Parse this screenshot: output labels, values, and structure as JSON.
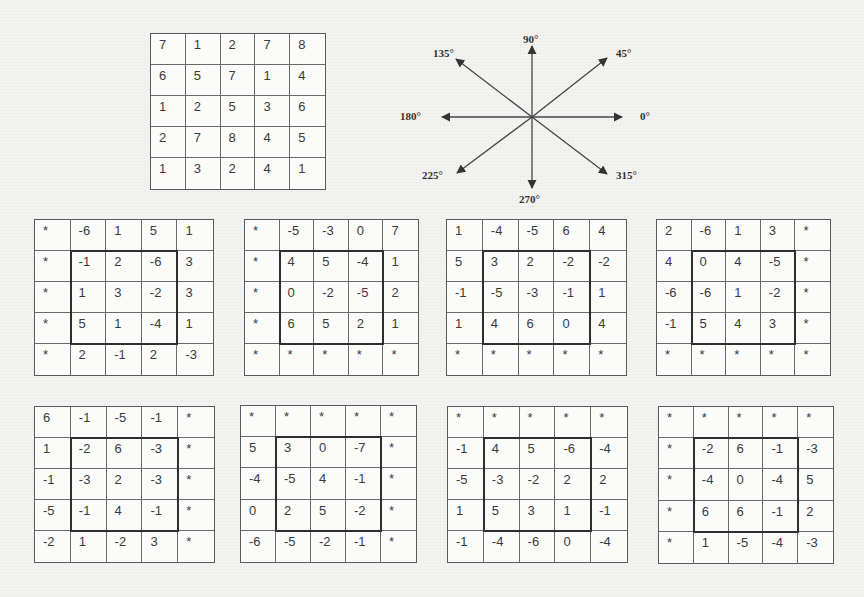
{
  "figure": {
    "source_grid": {
      "rows": [
        [
          "7",
          "1",
          "2",
          "7",
          "8"
        ],
        [
          "6",
          "5",
          "7",
          "1",
          "4"
        ],
        [
          "1",
          "2",
          "5",
          "3",
          "6"
        ],
        [
          "2",
          "7",
          "8",
          "4",
          "5"
        ],
        [
          "1",
          "3",
          "2",
          "4",
          "1"
        ]
      ]
    },
    "compass": {
      "labels": {
        "deg0": "0°",
        "deg45": "45°",
        "deg90": "90°",
        "deg135": "135°",
        "deg180": "180°",
        "deg225": "225°",
        "deg270": "270°",
        "deg315": "315°"
      }
    },
    "direction_grids": [
      {
        "rows": [
          [
            "*",
            "-6",
            "1",
            "5",
            "1"
          ],
          [
            "*",
            "-1",
            "2",
            "-6",
            "3"
          ],
          [
            "*",
            "1",
            "3",
            "-2",
            "3"
          ],
          [
            "*",
            "5",
            "1",
            "-4",
            "1"
          ],
          [
            "*",
            "2",
            "-1",
            "2",
            "-3"
          ]
        ]
      },
      {
        "rows": [
          [
            "*",
            "-5",
            "-3",
            "0",
            "7"
          ],
          [
            "*",
            "4",
            "5",
            "-4",
            "1"
          ],
          [
            "*",
            "0",
            "-2",
            "-5",
            "2"
          ],
          [
            "*",
            "6",
            "5",
            "2",
            "1"
          ],
          [
            "*",
            "*",
            "*",
            "*",
            "*"
          ]
        ]
      },
      {
        "rows": [
          [
            "1",
            "-4",
            "-5",
            "6",
            "4"
          ],
          [
            "5",
            "3",
            "2",
            "-2",
            "-2"
          ],
          [
            "-1",
            "-5",
            "-3",
            "-1",
            "1"
          ],
          [
            "1",
            "4",
            "6",
            "0",
            "4"
          ],
          [
            "*",
            "*",
            "*",
            "*",
            "*"
          ]
        ]
      },
      {
        "rows": [
          [
            "2",
            "-6",
            "1",
            "3",
            "*"
          ],
          [
            "4",
            "0",
            "4",
            "-5",
            "*"
          ],
          [
            "-6",
            "-6",
            "1",
            "-2",
            "*"
          ],
          [
            "-1",
            "5",
            "4",
            "3",
            "*"
          ],
          [
            "*",
            "*",
            "*",
            "*",
            "*"
          ]
        ]
      },
      {
        "rows": [
          [
            "6",
            "-1",
            "-5",
            "-1",
            "*"
          ],
          [
            "1",
            "-2",
            "6",
            "-3",
            "*"
          ],
          [
            "-1",
            "-3",
            "2",
            "-3",
            "*"
          ],
          [
            "-5",
            "-1",
            "4",
            "-1",
            "*"
          ],
          [
            "-2",
            "1",
            "-2",
            "3",
            "*"
          ]
        ]
      },
      {
        "rows": [
          [
            "*",
            "*",
            "*",
            "*",
            "*"
          ],
          [
            "5",
            "3",
            "0",
            "-7",
            "*"
          ],
          [
            "-4",
            "-5",
            "4",
            "-1",
            "*"
          ],
          [
            "0",
            "2",
            "5",
            "-2",
            "*"
          ],
          [
            "-6",
            "-5",
            "-2",
            "-1",
            "*"
          ]
        ]
      },
      {
        "rows": [
          [
            "*",
            "*",
            "*",
            "*",
            "*"
          ],
          [
            "-1",
            "4",
            "5",
            "-6",
            "-4"
          ],
          [
            "-5",
            "-3",
            "-2",
            "2",
            "2"
          ],
          [
            "1",
            "5",
            "3",
            "1",
            "-1"
          ],
          [
            "-1",
            "-4",
            "-6",
            "0",
            "-4"
          ]
        ]
      },
      {
        "rows": [
          [
            "*",
            "*",
            "*",
            "*",
            "*"
          ],
          [
            "*",
            "-2",
            "6",
            "-1",
            "-3"
          ],
          [
            "*",
            "-4",
            "0",
            "-4",
            "5"
          ],
          [
            "*",
            "6",
            "6",
            "-1",
            "2"
          ],
          [
            "*",
            "1",
            "-5",
            "-4",
            "-3"
          ]
        ]
      }
    ]
  }
}
